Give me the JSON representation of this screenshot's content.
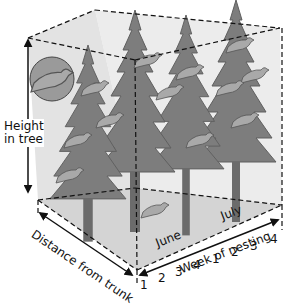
{
  "figure": {
    "axes": {
      "height": {
        "label_line1": "Height",
        "label_line2": "in tree"
      },
      "distance": {
        "label": "Distance from trunk"
      },
      "week": {
        "label": "Week of nesting",
        "months": [
          "June",
          "July"
        ],
        "ticks": [
          "1",
          "2",
          "3",
          "4",
          "1",
          "2",
          "3",
          "4"
        ]
      }
    },
    "colors": {
      "tree": "#7d7d7d",
      "tree_dark": "#5f5f5f",
      "trunk": "#6b6b6b",
      "box_face": "#e6e6e6",
      "ground": "#d2d2d2",
      "bird": "#a9a9a9",
      "line": "#111111"
    }
  }
}
